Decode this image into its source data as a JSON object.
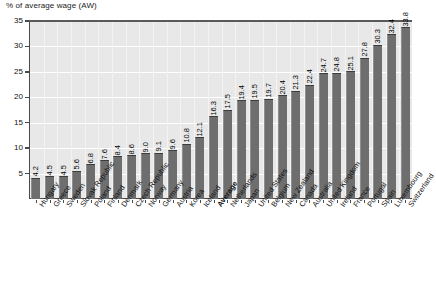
{
  "chart_data": {
    "type": "bar",
    "title": "% of average wage (AW)",
    "ylabel": "% of average wage (AW)",
    "xlabel": "",
    "ylim": [
      0,
      35
    ],
    "ytick_step": 5,
    "yticks": [
      5,
      10,
      15,
      20,
      25,
      30,
      35
    ],
    "grid": true,
    "legend": "none",
    "orientation": "vertical",
    "value_labels_rotated": true,
    "highlight_category": "Average",
    "categories": [
      "Hungary",
      "Greece",
      "Sweden",
      "Slovak Republic",
      "Poland",
      "Finland",
      "Denmark",
      "Czech Republic",
      "Norway",
      "Germany",
      "Austria",
      "Korea",
      "Iceland",
      "Average",
      "Netherlands",
      "Japan",
      "United States",
      "Belgium",
      "New Zealand",
      "Canada",
      "Australia",
      "United Kingdom",
      "Ireland",
      "France",
      "Portugal",
      "Spain",
      "Luxembourg",
      "Switzerland"
    ],
    "values": [
      4.2,
      4.5,
      4.5,
      5.6,
      6.8,
      7.6,
      8.4,
      8.6,
      9.0,
      9.1,
      9.6,
      10.8,
      12.1,
      16.3,
      17.5,
      19.4,
      19.5,
      19.7,
      20.4,
      21.3,
      22.4,
      24.7,
      24.8,
      25.1,
      27.8,
      30.3,
      32.4,
      33.8
    ],
    "value_label_format": "one-decimal",
    "colors": {
      "bar_fill": "#6e6e6e",
      "bar_top_edge": "#3c3c3c",
      "plot_background": "#e8e8e8",
      "gridline": "#ffffff",
      "axis_line": "#4a4a4a",
      "text": "#111111",
      "page_background": "#ffffff"
    }
  }
}
